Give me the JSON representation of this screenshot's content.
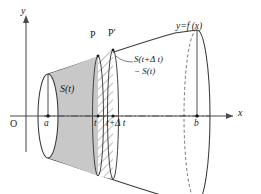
{
  "figure": {
    "title_implied": "Volume of a solid of revolution: cross-sectional area function S(t)",
    "axes": {
      "x_axis_label": "x",
      "y_axis_label": "y",
      "origin_label": "O"
    },
    "curve_label": "y=f (x)",
    "points": {
      "p_label": "P",
      "p_prime_label": "P′"
    },
    "x_marks": {
      "a": "a",
      "t": "t",
      "t_plus_delta": "t+Δ t",
      "b": "b"
    },
    "regions": {
      "shaded_area_label": "S(t)",
      "hatched_area_label_line1": "S(t+Δ t)",
      "hatched_area_label_line2": "− S(t)"
    },
    "colors": {
      "stroke": "#3a3a3a",
      "shaded_fill": "#c8c8c8",
      "hatch_stroke": "#5a5a5a",
      "axis": "#4a4a4a",
      "background": "#ffffff",
      "text": "#1a1a1a"
    },
    "geometry_hints": {
      "axis_y_pixel": 116,
      "x_a": 48,
      "x_t": 98,
      "x_t_delta": 113,
      "x_b": 197,
      "y_axis_x_pixel": 26
    }
  }
}
